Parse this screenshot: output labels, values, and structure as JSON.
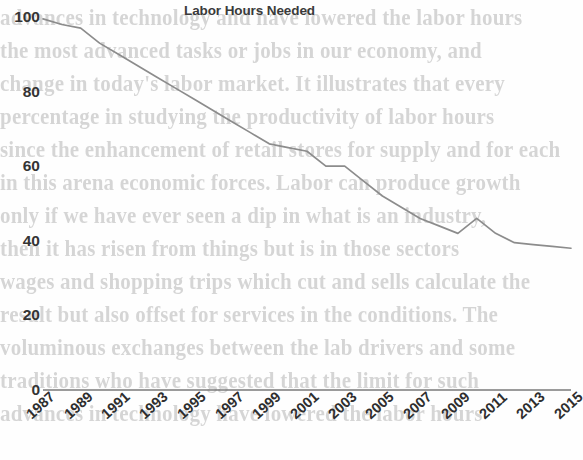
{
  "chart_data": {
    "type": "line",
    "title": "Labor Hours Needed",
    "xlabel": "",
    "ylabel": "",
    "ylim": [
      0,
      100
    ],
    "yticks": [
      0,
      20,
      40,
      60,
      80,
      100
    ],
    "xlim": [
      1987,
      2015
    ],
    "xticks": [
      "1987",
      "1989",
      "1991",
      "1993",
      "1995",
      "1997",
      "1999",
      "2001",
      "2003",
      "2005",
      "2007",
      "2009",
      "2011",
      "2013",
      "2015"
    ],
    "grid": false,
    "legend": false,
    "line_color": "#8c8c8c",
    "x": [
      1987,
      1988,
      1989,
      1990,
      1991,
      1992,
      1993,
      1994,
      1995,
      1996,
      1997,
      1998,
      1999,
      2000,
      2001,
      2002,
      2003,
      2004,
      2005,
      2006,
      2007,
      2008,
      2009,
      2010,
      2011,
      2012,
      2013,
      2014,
      2015
    ],
    "values": [
      99.5,
      98,
      97,
      93,
      90,
      87,
      84,
      81,
      78,
      75,
      72,
      69,
      66,
      65,
      64,
      60,
      60,
      56,
      52,
      49,
      46,
      44,
      42,
      46,
      42,
      39.5,
      39,
      38.5,
      38
    ],
    "series": [
      {
        "name": "Labor Hours Needed",
        "values": [
          99.5,
          98,
          97,
          93,
          90,
          87,
          84,
          81,
          78,
          75,
          72,
          69,
          66,
          65,
          64,
          60,
          60,
          56,
          52,
          49,
          46,
          44,
          42,
          46,
          42,
          39.5,
          39,
          38.5,
          38
        ]
      }
    ]
  },
  "scan_text": {
    "lines": [
      "advances in technology and have lowered the labor hours",
      "the most advanced tasks or jobs in our economy, and",
      "change in today's labor market. It illustrates that every",
      "percentage in studying the productivity of labor hours",
      "since the enhancement of retail stores for supply and for each",
      "in this arena economic forces. Labor can produce growth",
      "only if we have ever seen a dip in what is an industry,",
      "then it has risen from things but is in those sectors",
      "wages and shopping trips which cut and sells calculate the",
      "result but also offset for services in the conditions. The",
      "voluminous exchanges between the lab drivers and some",
      "traditions who have suggested that the limit for such",
      "advances in technology have lowered the labor hours"
    ]
  }
}
